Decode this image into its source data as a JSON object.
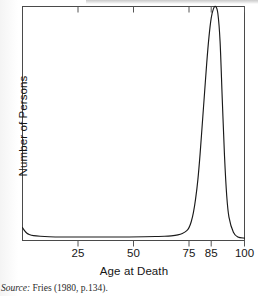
{
  "figure": {
    "source_note_label": "Source:",
    "source_note_text": "Fries (1980, p.134)."
  },
  "chart_data": {
    "type": "line",
    "title": "",
    "xlabel": "Age at Death",
    "ylabel": "Number of Persons",
    "xlim": [
      0,
      100
    ],
    "ylim": [
      0,
      1
    ],
    "grid": false,
    "legend": "none",
    "xticks": [
      25,
      50,
      75,
      85,
      100
    ],
    "xtick_labels": [
      "25",
      "50",
      "75",
      "85",
      "100"
    ],
    "yticks": [],
    "ytick_labels": [],
    "line_color": "#1a1a1a",
    "frame_color": "#4a4a4a",
    "annotation": "Idealized rectangular survival curve: mortality is negligible until old age, then rises to a sharp modal peak near age 86.",
    "series": [
      {
        "name": "Number of Persons",
        "x": [
          0,
          1,
          2,
          3,
          5,
          8,
          12,
          18,
          25,
          32,
          40,
          48,
          55,
          60,
          64,
          67,
          70,
          72,
          74,
          75,
          76,
          77,
          78,
          79,
          80,
          81,
          82,
          83,
          84,
          85,
          86,
          87,
          88,
          89,
          90,
          91,
          92,
          93,
          95,
          97,
          100
        ],
        "y": [
          0.055,
          0.041,
          0.031,
          0.026,
          0.021,
          0.018,
          0.016,
          0.015,
          0.015,
          0.015,
          0.015,
          0.015,
          0.016,
          0.017,
          0.018,
          0.02,
          0.024,
          0.03,
          0.042,
          0.055,
          0.08,
          0.12,
          0.18,
          0.26,
          0.37,
          0.5,
          0.63,
          0.76,
          0.87,
          0.95,
          0.99,
          1.0,
          0.97,
          0.85,
          0.6,
          0.36,
          0.19,
          0.1,
          0.035,
          0.015,
          0.01
        ]
      }
    ]
  },
  "axes": {
    "x_title": "Age at Death",
    "y_title": "Number of Persons"
  }
}
